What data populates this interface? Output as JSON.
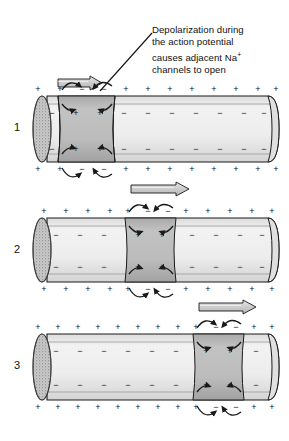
{
  "figure": {
    "caption_lines": [
      "Depolarization during",
      "the action potential",
      "causes adjacent Na",
      "channels to open"
    ],
    "caption_superscript": "+",
    "caption_full": "Depolarization during the action potential causes adjacent Na+ channels to open"
  },
  "colors": {
    "outline": "#1a1a1a",
    "membrane_fill": "#e8e8e8",
    "axoplasm_fill": "#efefef",
    "depolarized_fill": "#b9b9b9",
    "depolarized_fill_dark": "#a8a8a8",
    "end_cap_fill": "#c9c9c9",
    "arrow_fill": "#d0d0d0",
    "text": "#111111",
    "background": "#ffffff"
  },
  "panels": [
    {
      "number": "1",
      "label": "1",
      "description": "Depolarized region near the left end of the axon; local current flow opens adjacent sodium channels",
      "tube": {
        "x": 34,
        "y": 96,
        "width": 245,
        "height": 66
      },
      "depolarized_band": {
        "x": 58,
        "width": 57
      },
      "propagation_arrow": {
        "x": 58,
        "y": 76,
        "width": 44,
        "direction": "right"
      },
      "outer_signs": [
        "+",
        "+",
        "-",
        "-",
        "+",
        "+",
        "+",
        "+",
        "+",
        "+",
        "+",
        "+"
      ],
      "inner_signs": [
        "-",
        "+",
        "+",
        "-",
        "-",
        "-",
        "-",
        "-",
        "-",
        "-",
        "-"
      ],
      "depolarized_inner_signs": [
        "+",
        "+"
      ],
      "resting_inner_sign": "-",
      "resting_outer_sign": "+",
      "depolarized_outer_sign": "-"
    },
    {
      "number": "2",
      "label": "2",
      "description": "Depolarized region has moved to the middle of the axon",
      "tube": {
        "x": 34,
        "y": 218,
        "width": 245,
        "height": 64
      },
      "depolarized_band": {
        "x": 125,
        "width": 51
      },
      "propagation_arrow": {
        "x": 131,
        "y": 182,
        "width": 58,
        "direction": "right"
      },
      "outer_signs": [
        "+",
        "+",
        "+",
        "+",
        "+",
        "-",
        "-",
        "+",
        "+",
        "+",
        "+",
        "+"
      ],
      "depolarized_inner_signs": [
        "+",
        "+"
      ],
      "resting_inner_sign": "-",
      "resting_outer_sign": "+",
      "depolarized_outer_sign": "-"
    },
    {
      "number": "3",
      "label": "3",
      "description": "Depolarized region has moved to the right end of the axon",
      "tube": {
        "x": 34,
        "y": 334,
        "width": 245,
        "height": 66
      },
      "depolarized_band": {
        "x": 193,
        "width": 51
      },
      "propagation_arrow": {
        "x": 199,
        "y": 300,
        "width": 57,
        "direction": "right"
      },
      "outer_signs": [
        "+",
        "+",
        "+",
        "+",
        "+",
        "+",
        "+",
        "+",
        "+",
        "-",
        "-",
        "+"
      ],
      "depolarized_inner_signs": [
        "+",
        "+"
      ],
      "resting_inner_sign": "-",
      "resting_outer_sign": "+",
      "depolarized_outer_sign": "-"
    }
  ],
  "annotations": {
    "pointer_line": {
      "from_x": 152,
      "from_y": 33,
      "to_x": 100,
      "to_y": 91
    },
    "ion_flow_arrow_name": "curved-ion-flow-arrow",
    "ion_flow_count_per_panel": 8
  }
}
